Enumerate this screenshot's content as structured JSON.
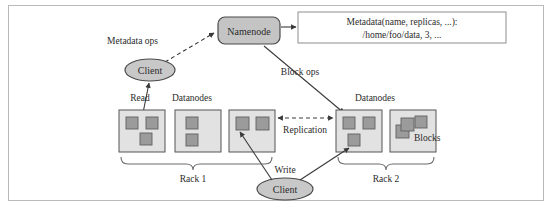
{
  "diagram": {
    "frame": {
      "border_color": "#b9b9bd",
      "background": "#ffffff"
    },
    "palette": {
      "namenode_fill": "#c4c4c4",
      "client_fill": "#c8c8c8",
      "datanode_fill": "#e2e2e2",
      "block_fill": "#9b9b9b",
      "stroke": "#4a4a4a",
      "text": "#2b2b2b",
      "metadata_box_border": "#8d8d8d"
    },
    "nodes": {
      "namenode": {
        "label": "Namenode",
        "shape": "rounded-rect",
        "fill": "#c4c4c4"
      },
      "metadata_box": {
        "line1": "Metadata(name, replicas, ...):",
        "line2": "/home/foo/data, 3, ...",
        "shape": "rect"
      },
      "client_read": {
        "label": "Client",
        "shape": "ellipse",
        "fill": "#c8c8c8"
      },
      "client_write": {
        "label": "Client",
        "shape": "ellipse",
        "fill": "#c8c8c8"
      }
    },
    "edge_labels": {
      "metadata_ops": "Metadata ops",
      "block_ops": "Block ops",
      "read": "Read",
      "write": "Write",
      "replication": "Replication"
    },
    "section_labels": {
      "datanodes_left": "Datanodes",
      "datanodes_right": "Datanodes",
      "blocks": "Blocks",
      "rack1": "Rack 1",
      "rack2": "Rack 2"
    },
    "racks": [
      {
        "name": "Rack 1",
        "datanodes": [
          {
            "id": "dn1",
            "blocks": 3,
            "layout": "two-top-one-bottom-right"
          },
          {
            "id": "dn2",
            "blocks": 2,
            "layout": "stacked-left"
          },
          {
            "id": "dn3",
            "blocks": 2,
            "layout": "two-top"
          }
        ]
      },
      {
        "name": "Rack 2",
        "datanodes": [
          {
            "id": "dn4",
            "blocks": 3,
            "layout": "two-top-one-bottom-left"
          },
          {
            "id": "dn5",
            "blocks": 3,
            "layout": "overlapping-cluster"
          }
        ]
      }
    ]
  }
}
